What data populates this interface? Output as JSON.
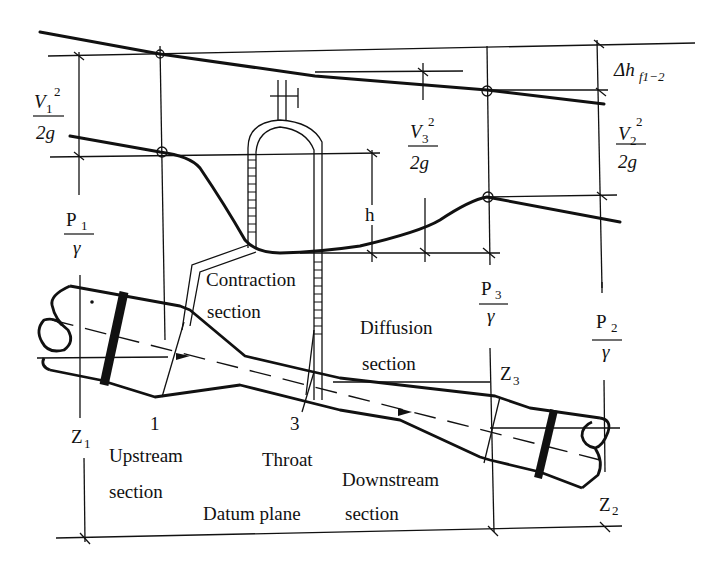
{
  "diagram": {
    "labels": {
      "v1_num": "V",
      "v1_sub": "1",
      "v1_sup": "2",
      "v1_den": "2g",
      "p1_num": "P",
      "p1_sub": "1",
      "p1_den": "γ",
      "v3_num": "V",
      "v3_sub": "3",
      "v3_sup": "2",
      "v3_den": "2g",
      "v2_num": "V",
      "v2_sub": "2",
      "v2_sup": "2",
      "v2_den": "2g",
      "p3_num": "P",
      "p3_sub": "3",
      "p3_den": "γ",
      "p2_num": "P",
      "p2_sub": "2",
      "p2_den": "γ",
      "headloss": "Δh",
      "headloss_sub": "f1−2",
      "h": "h",
      "z1": "Z",
      "z1_sub": "1",
      "z2": "Z",
      "z2_sub": "2",
      "z3": "Z",
      "z3_sub": "3",
      "section1": "1",
      "section3": "3",
      "contraction_1": "Contraction",
      "contraction_2": "section",
      "diffusion_1": "Diffusion",
      "diffusion_2": "section",
      "upstream_1": "Upstream",
      "upstream_2": "section",
      "throat": "Throat",
      "downstream_1": "Downstream",
      "downstream_2": "section",
      "datum": "Datum plane"
    }
  }
}
